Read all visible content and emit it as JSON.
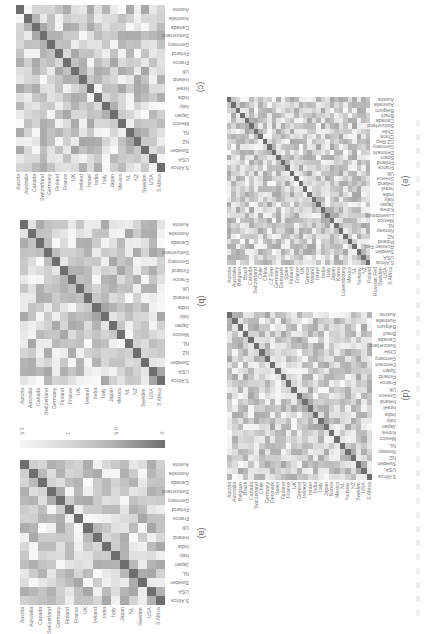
{
  "figure": {
    "orientation": "rotated 90 degrees",
    "panel_captions": [
      "(a)",
      "(b)",
      "(c)",
      "(d)",
      "(e)"
    ],
    "colorbar": {
      "ticks": [
        "1.5",
        "1",
        "0.5",
        "0"
      ],
      "colormap": "gray, dark=0, light=1.5"
    }
  },
  "chart_data": [
    {
      "type": "heatmap",
      "title": "(a)",
      "labels": [
        "Austria",
        "Australia",
        "Canada",
        "Switzerland",
        "Germany",
        "Finland",
        "France",
        "UK",
        "Ireland",
        "India",
        "Italy",
        "Japan",
        "NL",
        "Sweden",
        "USA",
        "S Africa"
      ],
      "diagonal": 0,
      "value_range": [
        0,
        1.5
      ]
    },
    {
      "type": "heatmap",
      "title": "(b)",
      "labels": [
        "Austria",
        "Australia",
        "Canada",
        "Switzerland",
        "Germany",
        "Finland",
        "France",
        "UK",
        "Ireland",
        "India",
        "Italy",
        "Japan",
        "Mexico",
        "NL",
        "NZ",
        "Sweden",
        "USA",
        "S Africa"
      ],
      "diagonal": 0,
      "value_range": [
        0,
        1.5
      ]
    },
    {
      "type": "heatmap",
      "title": "(c)",
      "labels": [
        "Austria",
        "Australia",
        "Canada",
        "Switzerland",
        "Germany",
        "Finland",
        "France",
        "UK",
        "Ireland",
        "Israel",
        "India",
        "Italy",
        "Japan",
        "Mexico",
        "NL",
        "NZ",
        "Sweden",
        "USA",
        "S Africa"
      ],
      "diagonal": 0,
      "value_range": [
        0,
        1.5
      ]
    },
    {
      "type": "heatmap",
      "title": "(d)",
      "labels": [
        "Austria",
        "Australia",
        "Belgium",
        "Brazil",
        "Canada",
        "Switzerland",
        "Chile",
        "Germany",
        "Denmark",
        "Spain",
        "Finland",
        "France",
        "UK",
        "Greece",
        "Ireland",
        "Israel",
        "India",
        "Italy",
        "Japan",
        "Korea",
        "Mexico",
        "NL",
        "Norway",
        "NZ",
        "Sweden",
        "USA",
        "S Africa"
      ],
      "diagonal": 0,
      "value_range": [
        0,
        1.5
      ]
    },
    {
      "type": "heatmap",
      "title": "(e)",
      "labels": [
        "Austria",
        "Australia",
        "Belgium",
        "Brazil",
        "Canada",
        "Switzerland",
        "Chile",
        "China",
        "CZ Rep",
        "Germany",
        "Denmark",
        "Spain",
        "Finland",
        "France",
        "UK",
        "Greece",
        "Ireland",
        "Israel",
        "India",
        "Italy",
        "Japan",
        "Korea",
        "Luxembourg",
        "Mexico",
        "NL",
        "Norway",
        "NZ",
        "Poland",
        "Russian Fed",
        "Sweden",
        "USA",
        "S Africa"
      ],
      "diagonal": 0,
      "value_range": [
        0,
        1.5
      ]
    }
  ]
}
